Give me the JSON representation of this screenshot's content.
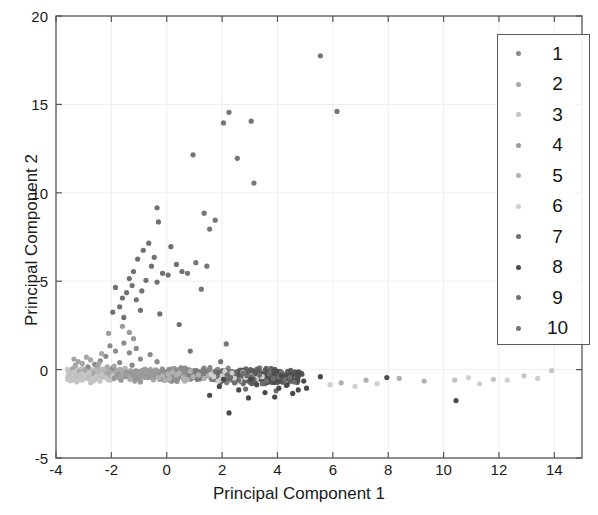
{
  "chart_data": {
    "type": "scatter",
    "title": "",
    "xlabel": "Principal Component 1",
    "ylabel": "Principal Component 2",
    "xlim": [
      -4,
      15
    ],
    "ylim": [
      -5,
      20
    ],
    "xticks": [
      "-4",
      "-2",
      "0",
      "2",
      "4",
      "6",
      "8",
      "10",
      "12",
      "14"
    ],
    "xtick_values": [
      -4,
      -2,
      0,
      2,
      4,
      6,
      8,
      10,
      12,
      14
    ],
    "yticks": [
      "-5",
      "0",
      "5",
      "10",
      "15",
      "20"
    ],
    "ytick_values": [
      -5,
      0,
      5,
      10,
      15,
      20
    ],
    "grid": true,
    "legend_position": "upper right",
    "legend_entries": [
      "1",
      "2",
      "3",
      "4",
      "5",
      "6",
      "7",
      "8",
      "9",
      "10"
    ],
    "marker": "circle",
    "marker_size": 4,
    "series": [
      {
        "name": "1",
        "color": "#8a8a8a",
        "points": [
          [
            -2.05,
            1.35
          ],
          [
            -1.85,
            1.05
          ],
          [
            -1.55,
            1.5
          ],
          [
            -1.35,
            0.95
          ],
          [
            -2.2,
            0.75
          ],
          [
            -1.1,
            1.2
          ],
          [
            -0.95,
            0.6
          ],
          [
            -2.4,
            0.5
          ],
          [
            -1.7,
            0.4
          ],
          [
            -0.6,
            0.85
          ],
          [
            -2.6,
            0.3
          ],
          [
            -1.25,
            0.25
          ],
          [
            -0.35,
            0.45
          ],
          [
            -2.85,
            0.15
          ],
          [
            -1.95,
            0.1
          ]
        ]
      },
      {
        "name": "2",
        "color": "#a6a6a6",
        "points": [
          [
            -3.3,
            0.25
          ],
          [
            -3.05,
            0.35
          ],
          [
            -2.75,
            0.55
          ],
          [
            -2.5,
            0.2
          ],
          [
            -3.15,
            -0.1
          ],
          [
            -2.9,
            0.7
          ],
          [
            -2.35,
            0.9
          ],
          [
            -3.4,
            0.05
          ],
          [
            -2.15,
            0.15
          ],
          [
            -2.65,
            -0.2
          ],
          [
            -3.2,
            0.45
          ],
          [
            -2.95,
            0.0
          ],
          [
            -2.45,
            0.35
          ],
          [
            -3.35,
            0.6
          ],
          [
            -2.1,
            -0.15
          ],
          [
            -1.9,
            0.2
          ]
        ]
      },
      {
        "name": "3",
        "color": "#c4c4c4",
        "points": [
          [
            -3.45,
            -0.35
          ],
          [
            -3.2,
            -0.45
          ],
          [
            -2.95,
            -0.3
          ],
          [
            -2.7,
            -0.5
          ],
          [
            -3.35,
            -0.15
          ],
          [
            -3.05,
            -0.6
          ],
          [
            -2.8,
            -0.2
          ],
          [
            -2.55,
            -0.4
          ],
          [
            -3.3,
            -0.55
          ],
          [
            -2.35,
            -0.3
          ],
          [
            -3.1,
            -0.25
          ],
          [
            -2.65,
            -0.65
          ],
          [
            -2.95,
            -0.45
          ],
          [
            -3.4,
            -0.25
          ],
          [
            -2.45,
            -0.55
          ],
          [
            -2.2,
            -0.45
          ],
          [
            -1.95,
            -0.35
          ],
          [
            -3.25,
            -0.7
          ],
          [
            -2.75,
            -0.75
          ],
          [
            -2.05,
            -0.6
          ],
          [
            10.4,
            -0.6
          ],
          [
            11.8,
            -0.55
          ],
          [
            12.9,
            -0.35
          ],
          [
            13.9,
            -0.05
          ]
        ]
      },
      {
        "name": "4",
        "color": "#999999",
        "points": [
          [
            -1.75,
            -0.25
          ],
          [
            -1.5,
            -0.4
          ],
          [
            -1.3,
            -0.2
          ],
          [
            -1.05,
            -0.5
          ],
          [
            -1.65,
            -0.6
          ],
          [
            -1.2,
            -0.35
          ],
          [
            -0.85,
            -0.25
          ],
          [
            -1.45,
            -0.15
          ],
          [
            -0.65,
            -0.45
          ],
          [
            -1.9,
            -0.5
          ],
          [
            -0.4,
            -0.3
          ],
          [
            -1.15,
            -0.65
          ],
          [
            -0.25,
            -0.55
          ],
          [
            -1.8,
            -0.35
          ],
          [
            -0.55,
            -0.15
          ],
          [
            -0.95,
            -0.7
          ],
          [
            -2.1,
            2.05
          ],
          [
            -1.6,
            2.45
          ],
          [
            -1.35,
            2.1
          ],
          [
            -1.2,
            1.75
          ]
        ]
      },
      {
        "name": "5",
        "color": "#b0b0b0",
        "points": [
          [
            -0.15,
            -0.35
          ],
          [
            0.1,
            -0.5
          ],
          [
            0.35,
            -0.3
          ],
          [
            0.6,
            -0.45
          ],
          [
            -0.05,
            -0.6
          ],
          [
            0.45,
            -0.2
          ],
          [
            0.75,
            -0.55
          ],
          [
            0.2,
            -0.15
          ],
          [
            0.95,
            -0.4
          ],
          [
            -0.3,
            -0.45
          ],
          [
            1.15,
            -0.3
          ],
          [
            0.65,
            -0.65
          ],
          [
            1.35,
            -0.5
          ],
          [
            0.05,
            -0.25
          ],
          [
            1.5,
            -0.35
          ],
          [
            0.85,
            -0.1
          ],
          [
            6.3,
            -0.75
          ],
          [
            7.2,
            -0.6
          ],
          [
            8.4,
            -0.5
          ],
          [
            9.3,
            -0.65
          ]
        ]
      },
      {
        "name": "6",
        "color": "#cfcfcf",
        "points": [
          [
            1.7,
            -0.4
          ],
          [
            1.95,
            -0.55
          ],
          [
            2.2,
            -0.3
          ],
          [
            2.45,
            -0.5
          ],
          [
            1.85,
            -0.65
          ],
          [
            2.35,
            -0.2
          ],
          [
            2.65,
            -0.6
          ],
          [
            2.1,
            -0.1
          ],
          [
            2.85,
            -0.45
          ],
          [
            1.6,
            -0.25
          ],
          [
            3.05,
            -0.35
          ],
          [
            2.55,
            -0.7
          ],
          [
            3.25,
            -0.5
          ],
          [
            2.0,
            -0.35
          ],
          [
            3.45,
            -0.4
          ],
          [
            2.75,
            -0.15
          ],
          [
            5.9,
            -0.85
          ],
          [
            6.8,
            -0.95
          ],
          [
            7.6,
            -0.8
          ],
          [
            10.9,
            -0.45
          ],
          [
            11.3,
            -0.8
          ],
          [
            12.3,
            -0.6
          ],
          [
            13.4,
            -0.5
          ]
        ]
      },
      {
        "name": "7",
        "color": "#6e6e6e",
        "points": [
          [
            2.3,
            -0.45
          ],
          [
            2.6,
            -0.6
          ],
          [
            2.9,
            -0.35
          ],
          [
            3.15,
            -0.55
          ],
          [
            2.45,
            -0.75
          ],
          [
            3.35,
            -0.3
          ],
          [
            3.6,
            -0.65
          ],
          [
            2.75,
            -0.2
          ],
          [
            3.85,
            -0.5
          ],
          [
            2.2,
            -0.3
          ],
          [
            4.05,
            -0.4
          ],
          [
            3.45,
            -0.8
          ],
          [
            4.25,
            -0.55
          ],
          [
            3.05,
            -0.4
          ],
          [
            4.45,
            -0.45
          ],
          [
            3.7,
            -0.25
          ],
          [
            2.85,
            -1.1
          ],
          [
            3.95,
            -1.2
          ],
          [
            4.6,
            -0.7
          ],
          [
            4.15,
            -0.15
          ]
        ]
      },
      {
        "name": "8",
        "color": "#4a4a4a",
        "points": [
          [
            1.55,
            -1.45
          ],
          [
            2.25,
            -2.45
          ],
          [
            2.95,
            -1.6
          ],
          [
            3.55,
            -1.3
          ],
          [
            4.05,
            -1.05
          ],
          [
            4.55,
            -1.35
          ],
          [
            1.9,
            -0.95
          ],
          [
            2.6,
            -1.15
          ],
          [
            3.25,
            -0.85
          ],
          [
            3.9,
            -1.55
          ],
          [
            4.35,
            -0.85
          ],
          [
            4.75,
            -1.15
          ],
          [
            5.55,
            -0.4
          ],
          [
            7.95,
            -0.45
          ],
          [
            10.45,
            -1.75
          ],
          [
            4.95,
            -0.65
          ],
          [
            2.05,
            -0.55
          ],
          [
            3.05,
            -0.55
          ],
          [
            4.15,
            -0.35
          ],
          [
            5.05,
            -1.05
          ]
        ]
      },
      {
        "name": "9",
        "color": "#707070",
        "points": [
          [
            -1.45,
            4.35
          ],
          [
            -1.25,
            4.75
          ],
          [
            -1.6,
            4.05
          ],
          [
            -1.1,
            3.95
          ],
          [
            -1.35,
            5.15
          ],
          [
            -0.9,
            4.45
          ],
          [
            -1.7,
            3.55
          ],
          [
            -0.75,
            5.05
          ],
          [
            -1.2,
            5.55
          ],
          [
            -1.85,
            4.65
          ],
          [
            -0.55,
            5.85
          ],
          [
            -1.05,
            6.25
          ],
          [
            -0.85,
            6.75
          ],
          [
            -0.35,
            4.95
          ],
          [
            -0.15,
            5.45
          ],
          [
            -0.45,
            6.35
          ],
          [
            -0.65,
            7.15
          ],
          [
            -0.3,
            8.35
          ],
          [
            -0.35,
            9.15
          ],
          [
            0.05,
            5.35
          ],
          [
            0.35,
            5.95
          ],
          [
            0.55,
            5.55
          ],
          [
            0.15,
            6.95
          ],
          [
            -1.95,
            3.25
          ],
          [
            -1.55,
            2.95
          ],
          [
            -0.95,
            3.35
          ],
          [
            -0.25,
            3.15
          ],
          [
            0.45,
            2.55
          ]
        ]
      },
      {
        "name": "10",
        "color": "#767676",
        "points": [
          [
            1.35,
            8.85
          ],
          [
            1.75,
            8.45
          ],
          [
            1.55,
            7.95
          ],
          [
            0.95,
            12.15
          ],
          [
            2.55,
            11.95
          ],
          [
            3.05,
            14.05
          ],
          [
            3.15,
            10.55
          ],
          [
            2.25,
            14.55
          ],
          [
            2.05,
            13.95
          ],
          [
            5.55,
            17.75
          ],
          [
            6.15,
            14.6
          ],
          [
            1.05,
            6.05
          ],
          [
            0.75,
            5.45
          ],
          [
            1.45,
            5.85
          ],
          [
            1.25,
            4.55
          ],
          [
            0.85,
            1.05
          ],
          [
            1.95,
            0.45
          ],
          [
            2.15,
            1.45
          ]
        ]
      }
    ]
  },
  "axes": {
    "xlabel": "Principal Component 1",
    "ylabel": "Principal Component 2"
  },
  "legend": {
    "items": [
      {
        "label": "1",
        "color": "#8a8a8a"
      },
      {
        "label": "2",
        "color": "#a6a6a6"
      },
      {
        "label": "3",
        "color": "#c4c4c4"
      },
      {
        "label": "4",
        "color": "#999999"
      },
      {
        "label": "5",
        "color": "#b0b0b0"
      },
      {
        "label": "6",
        "color": "#cfcfcf"
      },
      {
        "label": "7",
        "color": "#6e6e6e"
      },
      {
        "label": "8",
        "color": "#4a4a4a"
      },
      {
        "label": "9",
        "color": "#707070"
      },
      {
        "label": "10",
        "color": "#767676"
      }
    ]
  },
  "style": {
    "axis_color": "#555555",
    "grid_color": "#eeeeee",
    "text_color": "#1a1a1a",
    "background": "#ffffff"
  }
}
